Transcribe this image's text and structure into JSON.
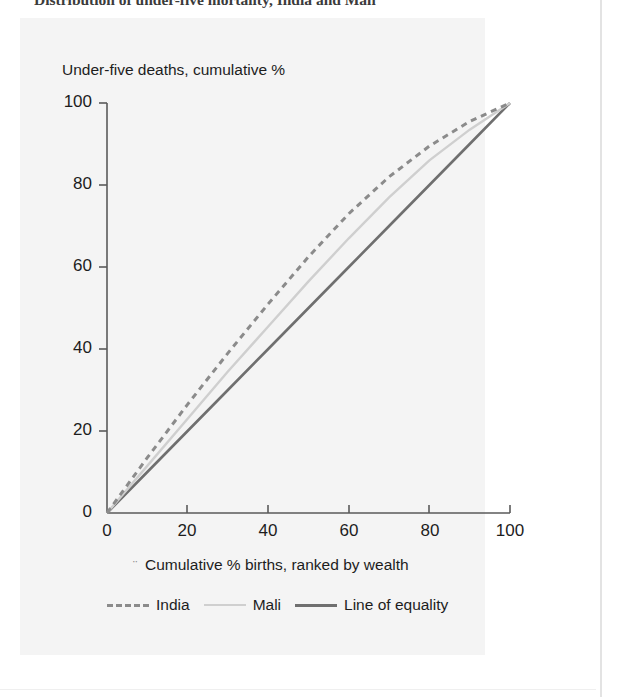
{
  "figure": {
    "title": "Distribution of under-five mortality, India and Mali"
  },
  "colors": {
    "panel_background": "#f4f4f4",
    "page_background": "#ffffff",
    "india": "#8b8b8b",
    "mali": "#cfcfcf",
    "line_of_equality": "#6f6f6f",
    "axis": "#5a5a5a",
    "text": "#1d1d1d"
  },
  "chart_data": {
    "type": "line",
    "title": "Distribution of under-five mortality, India and Mali",
    "xlabel": "Cumulative % births, ranked by wealth",
    "ylabel": "Under-five deaths, cumulative %",
    "xlim": [
      0,
      100
    ],
    "ylim": [
      0,
      100
    ],
    "xticks": [
      "0",
      "20",
      "40",
      "60",
      "80",
      "100"
    ],
    "yticks": [
      "0",
      "20",
      "40",
      "60",
      "80",
      "100"
    ],
    "grid": false,
    "legend_position": "below-axis",
    "x": [
      0,
      10,
      20,
      30,
      40,
      50,
      60,
      70,
      80,
      90,
      100
    ],
    "series": [
      {
        "name": "India",
        "style": "dashed",
        "color": "#8b8b8b",
        "values": [
          0,
          13.5,
          26.5,
          39,
          51,
          62.5,
          73,
          82,
          89.5,
          95.5,
          100
        ]
      },
      {
        "name": "Mali",
        "style": "solid-light",
        "color": "#cfcfcf",
        "values": [
          0,
          11.5,
          23,
          34.5,
          45.5,
          56.5,
          67,
          77,
          86,
          93.5,
          100
        ]
      },
      {
        "name": "Line of equality",
        "style": "solid",
        "color": "#6f6f6f",
        "values": [
          0,
          10,
          20,
          30,
          40,
          50,
          60,
          70,
          80,
          90,
          100
        ]
      }
    ]
  },
  "axes": {
    "x_title_mark": "¨",
    "x_title": "Cumulative % births, ranked by wealth",
    "y_title": "Under-five deaths, cumulative %",
    "x_tick_labels": [
      "0",
      "20",
      "40",
      "60",
      "80",
      "100"
    ],
    "y_tick_labels": [
      "100",
      "80",
      "60",
      "40",
      "20",
      "0"
    ]
  },
  "legend": {
    "items": [
      {
        "label": "India",
        "icon": "dashed-line-icon"
      },
      {
        "label": "Mali",
        "icon": "light-line-icon"
      },
      {
        "label": "Line of equality",
        "icon": "dark-line-icon"
      }
    ]
  }
}
